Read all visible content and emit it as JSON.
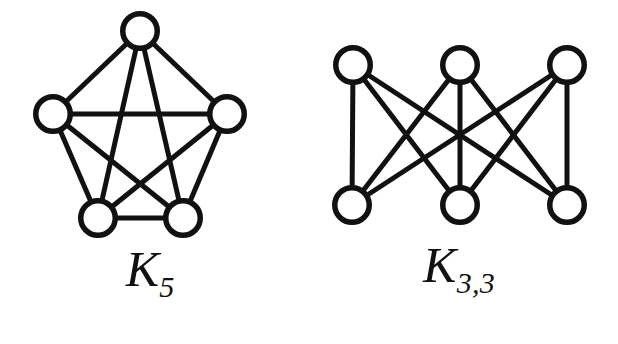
{
  "figure": {
    "background_color": "#ffffff",
    "stroke_color": "#111111",
    "vertex_fill_color": "#ffffff",
    "width": 618,
    "height": 344
  },
  "graphs": [
    {
      "id": "k5",
      "caption_letter": "K",
      "caption_subscript": "5",
      "caption_full": "K5",
      "type": "complete-graph",
      "vertex_count": 5,
      "edge_count": 10,
      "vertex_radius": 20,
      "vertices": [
        {
          "name": "top",
          "x": 140,
          "y": 31
        },
        {
          "name": "left",
          "x": 53,
          "y": 114
        },
        {
          "name": "right",
          "x": 227,
          "y": 114
        },
        {
          "name": "bottom-left",
          "x": 98,
          "y": 218
        },
        {
          "name": "bottom-right",
          "x": 183,
          "y": 218
        }
      ],
      "edges": [
        [
          0,
          1
        ],
        [
          0,
          2
        ],
        [
          0,
          3
        ],
        [
          0,
          4
        ],
        [
          1,
          2
        ],
        [
          1,
          3
        ],
        [
          1,
          4
        ],
        [
          2,
          3
        ],
        [
          2,
          4
        ],
        [
          3,
          4
        ]
      ]
    },
    {
      "id": "k33",
      "caption_letter": "K",
      "caption_subscript": "3,3",
      "caption_full": "K3,3",
      "type": "complete-bipartite-graph",
      "vertex_count": 6,
      "edge_count": 9,
      "vertex_radius": 20,
      "vertices": [
        {
          "name": "top-left",
          "x": 53,
          "y": 65
        },
        {
          "name": "top-middle",
          "x": 160,
          "y": 65
        },
        {
          "name": "top-right",
          "x": 267,
          "y": 65
        },
        {
          "name": "bottom-left",
          "x": 52,
          "y": 205
        },
        {
          "name": "bottom-middle",
          "x": 160,
          "y": 205
        },
        {
          "name": "bottom-right",
          "x": 267,
          "y": 205
        }
      ],
      "edges": [
        [
          0,
          3
        ],
        [
          0,
          4
        ],
        [
          0,
          5
        ],
        [
          1,
          3
        ],
        [
          1,
          4
        ],
        [
          1,
          5
        ],
        [
          2,
          3
        ],
        [
          2,
          4
        ],
        [
          2,
          5
        ]
      ]
    }
  ]
}
